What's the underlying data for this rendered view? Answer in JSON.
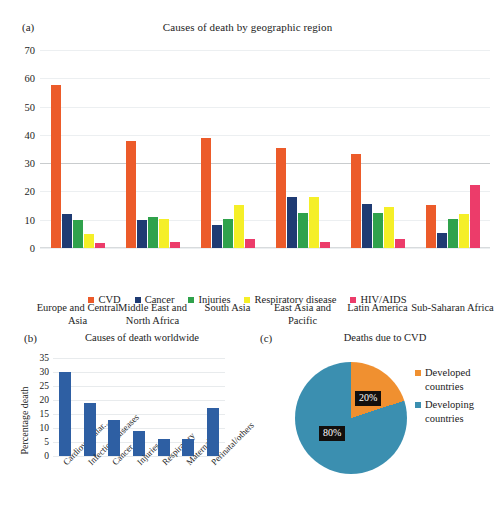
{
  "figure": {
    "panel_a_tag": "(a)",
    "panel_b_tag": "(b)",
    "panel_c_tag": "(c)"
  },
  "colors": {
    "cvd": "#ec5b2a",
    "cancer": "#1f3b73",
    "injuries": "#2fa24c",
    "respiratory": "#f5ef28",
    "hivaids": "#ec3c6a",
    "bar_blue": "#2e5fa3",
    "pie_developed": "#f09030",
    "pie_developing": "#3b8fb0",
    "grid": "#eceff1"
  },
  "chart_data": [
    {
      "type": "bar",
      "panel": "a",
      "title": "Causes of death by geographic region",
      "xlabel": "",
      "ylabel": "",
      "ylim": [
        0,
        70
      ],
      "yticks": [
        0,
        10,
        20,
        30,
        40,
        50,
        60,
        70
      ],
      "grid": true,
      "legend_position": "bottom",
      "categories": [
        "Europe and Central Asia",
        "Middle East and North Africa",
        "South Asia",
        "East Asia and Pacific",
        "Latin America",
        "Sub-Saharan Africa"
      ],
      "series": [
        {
          "name": "CVD",
          "values": [
            57.5,
            38.0,
            39.0,
            35.3,
            33.4,
            15.3
          ]
        },
        {
          "name": "Cancer",
          "values": [
            12.0,
            10.0,
            8.2,
            18.2,
            15.4,
            5.4
          ]
        },
        {
          "name": "Injuries",
          "values": [
            9.9,
            11.1,
            10.2,
            12.4,
            12.5,
            10.3
          ]
        },
        {
          "name": "Respiratory disease",
          "values": [
            5.0,
            10.1,
            15.1,
            18.2,
            14.4,
            12.2
          ]
        },
        {
          "name": "HIV/AIDS",
          "values": [
            1.8,
            2.0,
            3.2,
            2.1,
            3.3,
            22.3
          ]
        }
      ]
    },
    {
      "type": "bar",
      "panel": "b",
      "title": "Causes of death worldwide",
      "xlabel": "",
      "ylabel": "Percentage death",
      "ylim": [
        0,
        35
      ],
      "yticks": [
        0,
        5,
        10,
        15,
        20,
        25,
        30,
        35
      ],
      "grid": true,
      "categories": [
        "Cardiovascular...",
        "Infectious diseases",
        "Cancer",
        "Injuries",
        "Respiratory",
        "Maternal",
        "Perinatal/others"
      ],
      "values": [
        30,
        19,
        13,
        9,
        6,
        6,
        17
      ]
    },
    {
      "type": "pie",
      "panel": "c",
      "title": "Deaths due to CVD",
      "labels": [
        "Developed countries",
        "Developing countries"
      ],
      "legend_labels_line1": [
        "Developed",
        "Developing"
      ],
      "legend_labels_line2": [
        "countries",
        "countries"
      ],
      "values": [
        20,
        80
      ],
      "value_labels": [
        "20%",
        "80%"
      ],
      "legend_position": "right"
    }
  ]
}
